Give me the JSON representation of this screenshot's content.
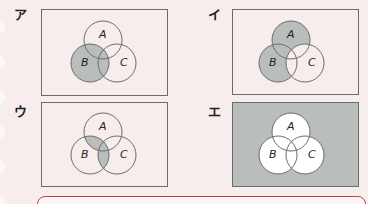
{
  "options": [
    {
      "label": "ア",
      "shaded": "B"
    },
    {
      "label": "イ",
      "shaded": "(A∪B) − C"
    },
    {
      "label": "ウ",
      "shaded": "(A∩B) ∪ (B∩C)"
    },
    {
      "label": "エ",
      "shaded": "complement of (A∪B∪C)"
    }
  ],
  "circle_labels": {
    "a": "A",
    "b": "B",
    "c": "C"
  },
  "colors": {
    "shade": "#b9bdbc",
    "line": "#6b6b6b",
    "background": "#f8eded",
    "answer_border": "#c0403f"
  }
}
